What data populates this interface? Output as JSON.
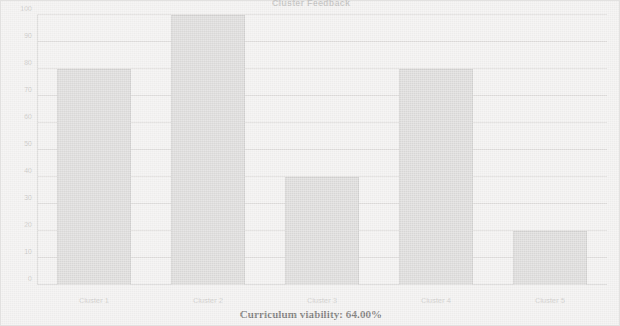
{
  "chart_data": {
    "type": "bar",
    "title": "Cluster Feedback",
    "xlabel": "",
    "ylabel": "",
    "categories": [
      "Cluster 1",
      "Cluster 2",
      "Cluster 3",
      "Cluster 4",
      "Cluster 5"
    ],
    "values": [
      80,
      100,
      40,
      80,
      20
    ],
    "ylim": [
      0,
      100
    ],
    "yticks": [
      0,
      10,
      20,
      30,
      40,
      50,
      60,
      70,
      80,
      90,
      100
    ],
    "ytick_labels": [
      "0",
      "10",
      "20",
      "30",
      "40",
      "50",
      "60",
      "70",
      "80",
      "90",
      "100"
    ],
    "grid": true,
    "legend": null,
    "annotation": "Curriculum viability: 64.00%"
  },
  "figure": {
    "caption": "Curriculum viability: 64.00%",
    "title": "Cluster Feedback"
  },
  "colors": {
    "background": "#f3f2f1",
    "bar_fill": "#dddcdb",
    "bar_edge": "#d2d1d0",
    "grid": "#cdcccb",
    "caption_text": "#7b7a79",
    "tick_text": "#cbcac9"
  }
}
